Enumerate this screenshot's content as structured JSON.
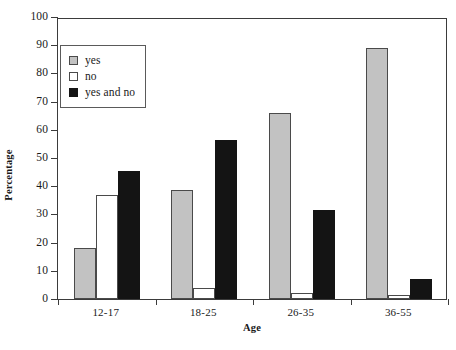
{
  "chart_data": {
    "type": "bar",
    "title": "",
    "xlabel": "Age",
    "ylabel": "Percentage",
    "categories": [
      "12-17",
      "18-25",
      "26-35",
      "36-55"
    ],
    "series": [
      {
        "name": "yes",
        "color": "#c2c2c2",
        "values": [
          18,
          38.5,
          66,
          89
        ]
      },
      {
        "name": "no",
        "color": "#ffffff",
        "values": [
          37,
          4,
          2,
          1.5
        ]
      },
      {
        "name": "yes and no",
        "color": "#141414",
        "values": [
          45.5,
          56.5,
          31.5,
          7
        ]
      }
    ],
    "ylim": [
      0,
      100
    ],
    "yticks": [
      0,
      10,
      20,
      30,
      40,
      50,
      60,
      70,
      80,
      90,
      100
    ],
    "ytick_labels": [
      "0",
      "10",
      "20",
      "30",
      "40",
      "50",
      "60",
      "70",
      "80",
      "90",
      "100"
    ],
    "grid": false,
    "legend_position": "upper left",
    "legend_entries": [
      "yes",
      "no",
      "yes and no"
    ]
  }
}
